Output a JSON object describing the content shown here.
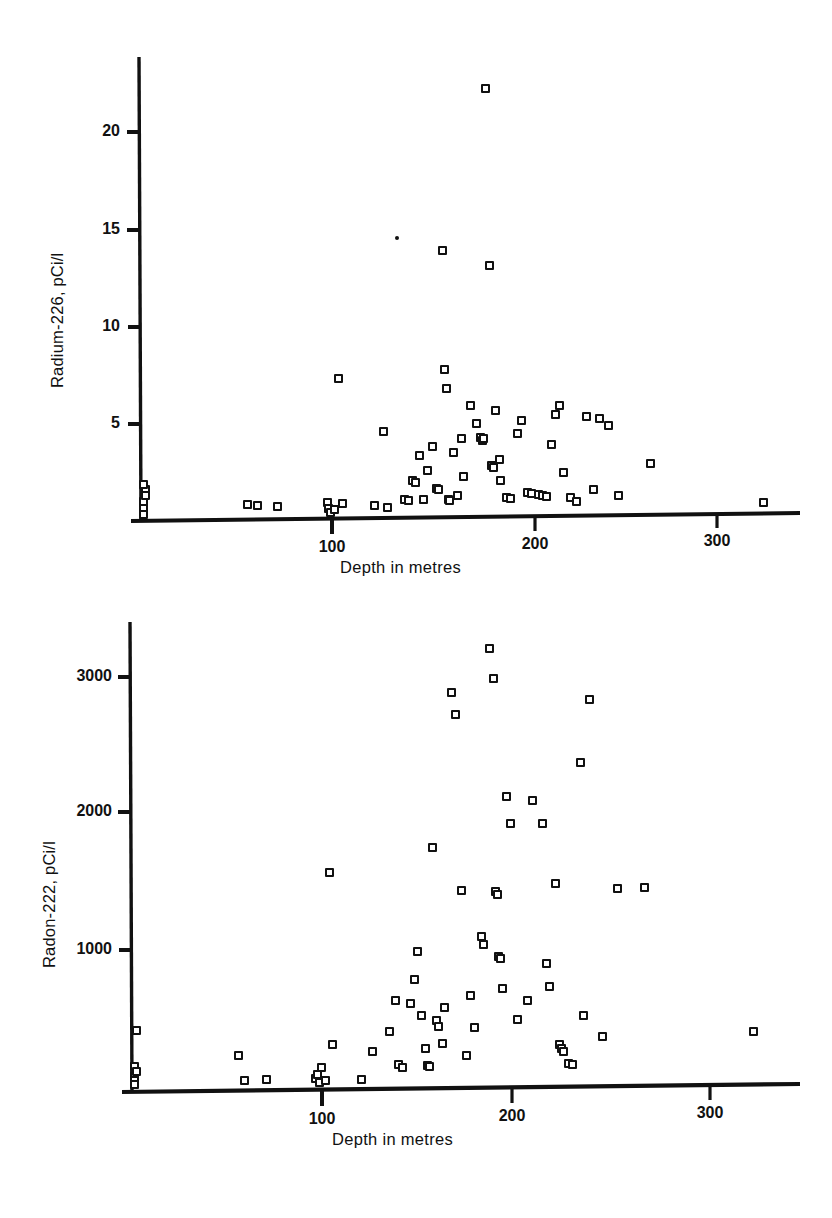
{
  "figure": {
    "background": "#ffffff",
    "ink_color": "#111111",
    "marker_style": "open-square"
  },
  "chart_data": [
    {
      "type": "scatter",
      "id": "radium-226-vs-depth",
      "title": "",
      "xlabel": "Depth in metres",
      "ylabel": "Radium-226, pCi/l",
      "xlim": [
        0,
        345
      ],
      "ylim": [
        0,
        24.5
      ],
      "xticks": [
        100,
        200,
        300
      ],
      "xtick_labels": [
        "100",
        "200",
        "300"
      ],
      "yticks": [
        5,
        10,
        15,
        20
      ],
      "ytick_labels": [
        "5",
        "10",
        "15",
        "20"
      ],
      "grid": false,
      "legend": null,
      "points": [
        [
          2,
          0.9
        ],
        [
          2,
          0.5
        ],
        [
          2,
          0.2
        ],
        [
          3,
          1.5
        ],
        [
          3,
          1.2
        ],
        [
          2,
          1.8
        ],
        [
          57,
          0.7
        ],
        [
          62,
          0.65
        ],
        [
          73,
          0.6
        ],
        [
          99,
          0.8
        ],
        [
          100,
          0.5
        ],
        [
          101,
          0.3
        ],
        [
          103,
          0.45
        ],
        [
          105,
          7.4
        ],
        [
          107,
          0.75
        ],
        [
          124,
          0.65
        ],
        [
          129,
          4.6
        ],
        [
          131,
          0.55
        ],
        [
          136,
          14.9
        ],
        [
          140,
          1.0
        ],
        [
          142,
          0.95
        ],
        [
          144,
          2.0
        ],
        [
          146,
          1.9
        ],
        [
          148,
          3.3
        ],
        [
          150,
          1.0
        ],
        [
          152,
          2.5
        ],
        [
          155,
          3.8
        ],
        [
          157,
          1.55
        ],
        [
          158,
          1.5
        ],
        [
          160,
          14.2
        ],
        [
          161,
          7.9
        ],
        [
          162,
          6.9
        ],
        [
          163,
          1.0
        ],
        [
          164,
          0.95
        ],
        [
          166,
          3.5
        ],
        [
          168,
          1.2
        ],
        [
          170,
          4.2
        ],
        [
          171,
          2.2
        ],
        [
          175,
          6.0
        ],
        [
          178,
          5.0
        ],
        [
          180,
          4.3
        ],
        [
          181,
          4.1
        ],
        [
          182,
          4.2
        ],
        [
          183,
          22.8
        ],
        [
          185,
          13.4
        ],
        [
          186,
          2.8
        ],
        [
          187,
          2.7
        ],
        [
          188,
          5.7
        ],
        [
          190,
          3.1
        ],
        [
          191,
          2.0
        ],
        [
          194,
          1.1
        ],
        [
          196,
          1.05
        ],
        [
          200,
          4.5
        ],
        [
          202,
          5.2
        ],
        [
          205,
          1.35
        ],
        [
          207,
          1.3
        ],
        [
          211,
          1.25
        ],
        [
          213,
          1.2
        ],
        [
          215,
          1.15
        ],
        [
          218,
          3.9
        ],
        [
          220,
          5.5
        ],
        [
          222,
          6.0
        ],
        [
          224,
          2.4
        ],
        [
          228,
          1.1
        ],
        [
          231,
          0.9
        ],
        [
          236,
          5.4
        ],
        [
          240,
          1.5
        ],
        [
          243,
          5.3
        ],
        [
          248,
          4.9
        ],
        [
          253,
          1.2
        ],
        [
          270,
          2.9
        ],
        [
          330,
          0.8
        ]
      ]
    },
    {
      "type": "scatter",
      "id": "radon-222-vs-depth",
      "title": "",
      "xlabel": "Depth in metres",
      "ylabel": "Radon-222, pCi/l",
      "xlim": [
        0,
        345
      ],
      "ylim": [
        0,
        3500
      ],
      "xticks": [
        100,
        200,
        300
      ],
      "xtick_labels": [
        "100",
        "200",
        "300"
      ],
      "yticks": [
        1000,
        2000,
        3000
      ],
      "ytick_labels": [
        "1000",
        "2000",
        "3000"
      ],
      "grid": false,
      "legend": null,
      "points": [
        [
          2,
          100
        ],
        [
          2,
          60
        ],
        [
          2,
          30
        ],
        [
          3,
          440
        ],
        [
          2,
          170
        ],
        [
          3,
          130
        ],
        [
          57,
          250
        ],
        [
          60,
          60
        ],
        [
          72,
          70
        ],
        [
          98,
          80
        ],
        [
          99,
          110
        ],
        [
          100,
          50
        ],
        [
          101,
          160
        ],
        [
          103,
          60
        ],
        [
          105,
          1620
        ],
        [
          107,
          330
        ],
        [
          122,
          70
        ],
        [
          128,
          280
        ],
        [
          137,
          430
        ],
        [
          140,
          660
        ],
        [
          142,
          180
        ],
        [
          144,
          160
        ],
        [
          148,
          640
        ],
        [
          150,
          820
        ],
        [
          152,
          1030
        ],
        [
          154,
          550
        ],
        [
          156,
          300
        ],
        [
          157,
          175
        ],
        [
          158,
          170
        ],
        [
          160,
          1810
        ],
        [
          162,
          510
        ],
        [
          163,
          470
        ],
        [
          165,
          340
        ],
        [
          166,
          610
        ],
        [
          170,
          2970
        ],
        [
          172,
          2810
        ],
        [
          175,
          1490
        ],
        [
          178,
          250
        ],
        [
          180,
          700
        ],
        [
          182,
          460
        ],
        [
          186,
          1140
        ],
        [
          187,
          1080
        ],
        [
          190,
          3300
        ],
        [
          192,
          3080
        ],
        [
          193,
          1480
        ],
        [
          194,
          1460
        ],
        [
          195,
          990
        ],
        [
          196,
          980
        ],
        [
          197,
          750
        ],
        [
          199,
          2190
        ],
        [
          201,
          1990
        ],
        [
          205,
          520
        ],
        [
          210,
          660
        ],
        [
          213,
          2160
        ],
        [
          218,
          1990
        ],
        [
          220,
          940
        ],
        [
          222,
          770
        ],
        [
          225,
          1540
        ],
        [
          227,
          330
        ],
        [
          228,
          300
        ],
        [
          229,
          280
        ],
        [
          232,
          190
        ],
        [
          234,
          180
        ],
        [
          238,
          2450
        ],
        [
          240,
          550
        ],
        [
          243,
          2920
        ],
        [
          250,
          390
        ],
        [
          258,
          1500
        ],
        [
          272,
          1510
        ],
        [
          330,
          430
        ]
      ]
    }
  ]
}
